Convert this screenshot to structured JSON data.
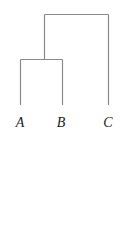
{
  "diagram": {
    "type": "dendrogram",
    "leaves": [
      {
        "label": "A",
        "x": 20,
        "y": 123
      },
      {
        "label": "B",
        "x": 62,
        "y": 123
      },
      {
        "label": "C",
        "x": 108,
        "y": 123
      }
    ],
    "merges": [
      {
        "children": [
          "A",
          "B"
        ],
        "height_y": 59
      },
      {
        "children": [
          "AB",
          "C"
        ],
        "height_y": 14
      }
    ],
    "line_color": "#8a8a8a"
  }
}
